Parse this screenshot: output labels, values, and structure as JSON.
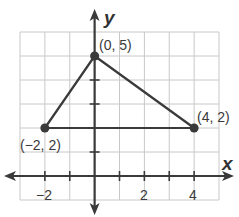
{
  "chart_data": {
    "type": "scatter",
    "title": "",
    "xlabel": "x",
    "ylabel": "y",
    "xlim": [
      -3,
      5
    ],
    "ylim": [
      -1,
      6
    ],
    "grid": true,
    "x_tick_labels": [
      "-2",
      "2",
      "4"
    ],
    "x_tick_label_values": [
      -2,
      2,
      4
    ],
    "x_ticks": [
      -2,
      -1,
      1,
      2,
      3,
      4
    ],
    "y_ticks": [
      1,
      2,
      3,
      4
    ],
    "points": [
      {
        "x": 0,
        "y": 5,
        "label": "(0, 5)"
      },
      {
        "x": 4,
        "y": 2,
        "label": "(4, 2)"
      },
      {
        "x": -2,
        "y": 2,
        "label": "(−2, 2)"
      }
    ],
    "polygon": {
      "shape": "triangle",
      "vertices": [
        [
          0,
          5
        ],
        [
          4,
          2
        ],
        [
          -2,
          2
        ]
      ]
    }
  },
  "labels": {
    "x_axis": "x",
    "y_axis": "y",
    "tick_neg2": "−2",
    "tick_2": "2",
    "tick_4": "4",
    "pt_a": "(0, 5)",
    "pt_b": "(4, 2)",
    "pt_c": "(−2, 2)"
  },
  "colors": {
    "grid": "#c8c8c8",
    "axis": "#3a3a3a",
    "triangle": "#3a3a3a"
  }
}
